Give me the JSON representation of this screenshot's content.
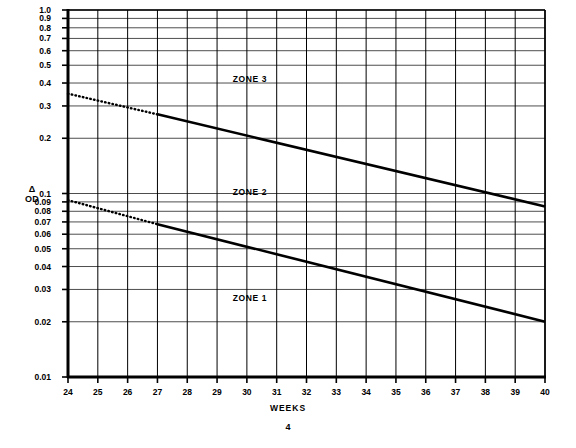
{
  "document": {
    "page_number": "4"
  },
  "chart_data": {
    "type": "line",
    "title": "",
    "xlabel": "WEEKS",
    "ylabel": "Δ OD",
    "ylabel_lines": [
      "Δ",
      "OD"
    ],
    "xscale": "linear",
    "yscale": "log",
    "xlim": [
      24,
      40
    ],
    "ylim": [
      0.01,
      1.0
    ],
    "grid": true,
    "legend": null,
    "x_ticks": [
      24,
      25,
      26,
      27,
      28,
      29,
      30,
      31,
      32,
      33,
      34,
      35,
      36,
      37,
      38,
      39,
      40
    ],
    "x_tick_labels": [
      "24",
      "25",
      "26",
      "27",
      "28",
      "29",
      "30",
      "31",
      "32",
      "33",
      "34",
      "35",
      "36",
      "37",
      "38",
      "39",
      "40"
    ],
    "y_ticks": [
      0.01,
      0.02,
      0.03,
      0.04,
      0.05,
      0.06,
      0.07,
      0.08,
      0.09,
      0.1,
      0.2,
      0.3,
      0.4,
      0.5,
      0.6,
      0.7,
      0.8,
      0.9,
      1.0
    ],
    "y_tick_labels": [
      "0.01",
      "0.02",
      "0.03",
      "0.04",
      "0.05",
      "0.06",
      "0.07",
      "0.08",
      "0.09",
      "0.1",
      "0.2",
      "0.3",
      "0.4",
      "0.5",
      "0.6",
      "0.7",
      "0.8",
      "0.9",
      "1.0"
    ],
    "series": [
      {
        "name": "Zone 3 / Zone 2 boundary",
        "style": "dotted",
        "segment": "extrapolated",
        "x": [
          24,
          27
        ],
        "values": [
          0.35,
          0.27
        ]
      },
      {
        "name": "Zone 3 / Zone 2 boundary",
        "style": "solid",
        "segment": "measured",
        "x": [
          27,
          40
        ],
        "values": [
          0.27,
          0.085
        ]
      },
      {
        "name": "Zone 2 / Zone 1 boundary",
        "style": "dotted",
        "segment": "extrapolated",
        "x": [
          24,
          27
        ],
        "values": [
          0.092,
          0.068
        ]
      },
      {
        "name": "Zone 2 / Zone 1 boundary",
        "style": "solid",
        "segment": "measured",
        "x": [
          27,
          40
        ],
        "values": [
          0.068,
          0.02
        ]
      }
    ],
    "annotations": [
      {
        "text": "ZONE 3",
        "x": 30.1,
        "y": 0.42
      },
      {
        "text": "ZONE 2",
        "x": 30.1,
        "y": 0.102
      },
      {
        "text": "ZONE 1",
        "x": 30.1,
        "y": 0.027
      }
    ]
  }
}
